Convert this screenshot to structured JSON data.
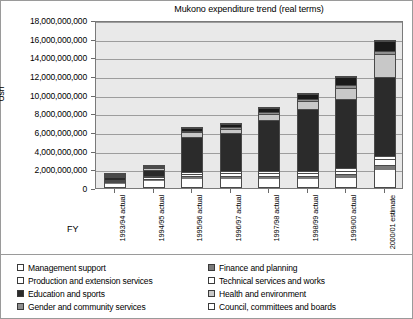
{
  "chart_data": {
    "type": "bar",
    "subtype": "stacked",
    "title": "Mukono expenditure trend (real terms)",
    "xlabel": "FY",
    "ylabel": "Ush",
    "ylim": [
      0,
      18000000000
    ],
    "ytick_step": 2000000000,
    "ytick_labels": [
      "18,000,000,000",
      "16,000,000,000",
      "14,000,000,000",
      "12,000,000,000",
      "10,000,000,000",
      "8,000,000,000",
      "6,000,000,000",
      "4,000,000,000",
      "2,000,000,000",
      "0"
    ],
    "grid": true,
    "legend_position": "bottom",
    "categories": [
      "1993/94 actual",
      "1994/95 actual",
      "1995/96 actual",
      "1996/97 actual",
      "1997/98 actual",
      "1998/99 actual",
      "1999/00 actual",
      "2000/01 estimate"
    ],
    "series": [
      {
        "name": "Management support",
        "color": "#ffffff",
        "values": [
          500000000,
          700000000,
          900000000,
          900000000,
          900000000,
          900000000,
          1000000000,
          1900000000
        ]
      },
      {
        "name": "Finance and planning",
        "color": "#7a7a7a",
        "values": [
          200000000,
          250000000,
          300000000,
          300000000,
          300000000,
          350000000,
          400000000,
          500000000
        ]
      },
      {
        "name": "Production and extension services",
        "color": "#ffffff",
        "values": [
          150000000,
          200000000,
          250000000,
          300000000,
          300000000,
          300000000,
          400000000,
          600000000
        ]
      },
      {
        "name": "Technical services and works",
        "color": "#ffffff",
        "values": [
          100000000,
          150000000,
          200000000,
          250000000,
          250000000,
          250000000,
          300000000,
          400000000
        ]
      },
      {
        "name": "Education and sports",
        "color": "#2b2b2b",
        "values": [
          400000000,
          700000000,
          3900000000,
          4200000000,
          5600000000,
          6700000000,
          7500000000,
          8500000000
        ]
      },
      {
        "name": "Health and environment",
        "color": "#c8c8c8",
        "values": [
          100000000,
          200000000,
          500000000,
          500000000,
          700000000,
          900000000,
          1200000000,
          2500000000
        ]
      },
      {
        "name": "Gender and community services",
        "color": "#8f8f8f",
        "values": [
          50000000,
          100000000,
          150000000,
          150000000,
          200000000,
          250000000,
          300000000,
          400000000
        ]
      },
      {
        "name": "Council, committees and boards",
        "color": "#1a1a1a",
        "values": [
          100000000,
          200000000,
          300000000,
          400000000,
          400000000,
          500000000,
          900000000,
          1100000000
        ]
      }
    ],
    "totals": [
      1600000000,
      2500000000,
      6500000000,
      7000000000,
      8650000000,
      10150000000,
      12000000000,
      15900000000
    ]
  },
  "legend": {
    "left_column": [
      {
        "label": "Management support",
        "swatch": "#ffffff"
      },
      {
        "label": "Production and extension services",
        "swatch": "#ffffff"
      },
      {
        "label": "Education and sports",
        "swatch": "#2b2b2b"
      },
      {
        "label": "Gender and community services",
        "swatch": "#8f8f8f"
      }
    ],
    "right_column": [
      {
        "label": "Finance and planning",
        "swatch": "#7a7a7a"
      },
      {
        "label": "Technical services and works",
        "swatch": "#ffffff"
      },
      {
        "label": "Health and environment",
        "swatch": "#c8c8c8"
      },
      {
        "label": "Council, committees and boards",
        "swatch": "#ffffff"
      }
    ]
  }
}
